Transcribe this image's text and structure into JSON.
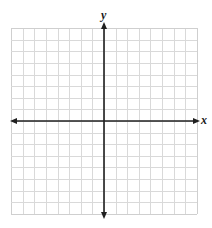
{
  "diagram": {
    "type": "coordinate-plane",
    "x_axis_label": "x",
    "y_axis_label": "y",
    "grid": {
      "columns_left_of_y_axis": 8,
      "columns_right_of_y_axis": 8,
      "rows_above_x_axis": 8,
      "rows_below_x_axis": 8,
      "cell_size_px": 11.6,
      "line_color": "#d9d9d9",
      "border_color": "#cfcfcf"
    },
    "axes": {
      "color": "#1f1f1f",
      "arrows": [
        "left",
        "right",
        "up",
        "down"
      ]
    },
    "tick_labels": [],
    "points": [],
    "background": "#ffffff"
  }
}
